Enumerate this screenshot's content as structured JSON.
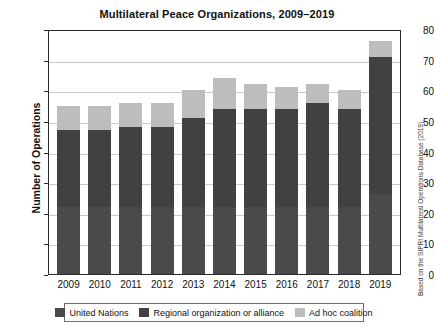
{
  "chart_data": {
    "type": "bar",
    "title": "Multilateral Peace Organizations, 2009–2019",
    "xlabel": "",
    "ylabel": "Number of Operations",
    "ylim": [
      0,
      80
    ],
    "ytick_step": 10,
    "grid": true,
    "stacked": true,
    "legend_position": "bottom",
    "categories": [
      "2009",
      "2010",
      "2011",
      "2012",
      "2013",
      "2014",
      "2015",
      "2016",
      "2017",
      "2018",
      "2019"
    ],
    "yticks": [
      "0",
      "10",
      "20",
      "30",
      "40",
      "50",
      "60",
      "70",
      "80"
    ],
    "series": [
      {
        "name": "United Nations",
        "color": "#4a4a4a",
        "values": [
          22,
          22,
          22,
          22,
          22,
          22,
          22,
          22,
          22,
          22,
          26
        ]
      },
      {
        "name": "Regional organization or alliance",
        "color": "#414141",
        "values": [
          25,
          25,
          26,
          26,
          29,
          32,
          32,
          32,
          34,
          32,
          45
        ]
      },
      {
        "name": "Ad hoc coalition",
        "color": "#bdbdbd",
        "values": [
          8,
          8,
          8,
          8,
          9,
          10,
          8,
          7,
          6,
          6,
          5
        ]
      }
    ],
    "totals": [
      55,
      55,
      56,
      56,
      60,
      64,
      62,
      61,
      62,
      60,
      76
    ]
  },
  "source_note": "Based on the SIPRI Multilateral Operations Database (2019).",
  "legend": {
    "items": [
      {
        "label": "United Nations"
      },
      {
        "label": "Regional organization or alliance"
      },
      {
        "label": "Ad hoc coalition"
      }
    ]
  }
}
